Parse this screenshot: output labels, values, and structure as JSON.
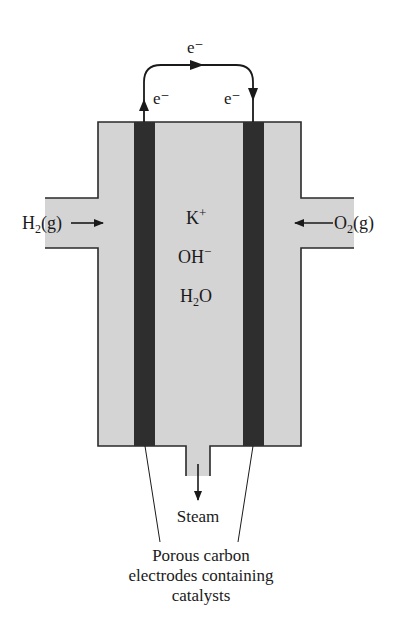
{
  "diagram": {
    "colors": {
      "electrolyte": "#d4d4d4",
      "electrode": "#2e2e2e",
      "outline": "#2a2a2a",
      "text": "#1a1a1a"
    },
    "circuit": {
      "top_label": "e⁻",
      "left_label": "e⁻",
      "right_label": "e⁻"
    },
    "inputs": {
      "left": {
        "formula": "H",
        "subscript": "2",
        "state": "(g)"
      },
      "right": {
        "formula": "O",
        "subscript": "2",
        "state": "(g)"
      }
    },
    "electrolyte_species": [
      {
        "base": "K",
        "sup": "+",
        "sub": ""
      },
      {
        "base": "OH",
        "sup": "−",
        "sub": ""
      },
      {
        "base": "H",
        "sup": "",
        "sub": "2",
        "tail": "O"
      }
    ],
    "outlet": {
      "label": "Steam"
    },
    "electrode_caption": {
      "lines": [
        "Porous carbon",
        "electrodes containing",
        "catalysts"
      ]
    }
  }
}
